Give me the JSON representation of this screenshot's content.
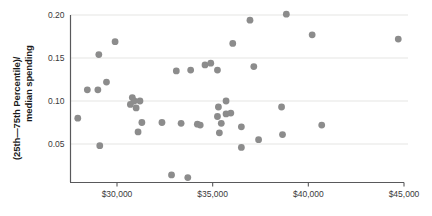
{
  "chart_data": {
    "type": "scatter",
    "title": "",
    "xlabel": "",
    "ylabel": "(25th—75th Percentile)/ median spending",
    "ylabel_line1": "(25th—75th Percentile)/",
    "ylabel_line2": "median spending",
    "xlim": [
      27600,
      45600
    ],
    "ylim": [
      0.0,
      0.2
    ],
    "xticks": [
      30000,
      35000,
      40000,
      45000
    ],
    "xtick_labels": [
      "$30,000",
      "$35,000",
      "$40,000",
      "$45,000"
    ],
    "yticks": [
      0.05,
      0.1,
      0.15,
      0.2
    ],
    "ytick_labels": [
      "0.05",
      "0.10",
      "0.15",
      "0.20"
    ],
    "grid": "horizontal",
    "legend": "none",
    "marker_color": "#8c8c8c",
    "gridline_color": "#dededc",
    "axis_color": "#59595b",
    "points": [
      {
        "x": 29900,
        "y": 0.169
      },
      {
        "x": 29050,
        "y": 0.154
      },
      {
        "x": 28450,
        "y": 0.113
      },
      {
        "x": 29000,
        "y": 0.113
      },
      {
        "x": 29450,
        "y": 0.122
      },
      {
        "x": 27950,
        "y": 0.08
      },
      {
        "x": 29100,
        "y": 0.048
      },
      {
        "x": 30800,
        "y": 0.104
      },
      {
        "x": 30900,
        "y": 0.1
      },
      {
        "x": 30700,
        "y": 0.096
      },
      {
        "x": 31000,
        "y": 0.092
      },
      {
        "x": 31200,
        "y": 0.1
      },
      {
        "x": 31300,
        "y": 0.075
      },
      {
        "x": 31100,
        "y": 0.064
      },
      {
        "x": 32350,
        "y": 0.075
      },
      {
        "x": 33100,
        "y": 0.135
      },
      {
        "x": 33850,
        "y": 0.136
      },
      {
        "x": 34600,
        "y": 0.142
      },
      {
        "x": 34900,
        "y": 0.144
      },
      {
        "x": 33350,
        "y": 0.074
      },
      {
        "x": 34200,
        "y": 0.073
      },
      {
        "x": 34350,
        "y": 0.072
      },
      {
        "x": 32850,
        "y": 0.014
      },
      {
        "x": 33700,
        "y": 0.011
      },
      {
        "x": 35250,
        "y": 0.136
      },
      {
        "x": 36050,
        "y": 0.167
      },
      {
        "x": 36950,
        "y": 0.194
      },
      {
        "x": 35700,
        "y": 0.1
      },
      {
        "x": 35300,
        "y": 0.093
      },
      {
        "x": 35950,
        "y": 0.086
      },
      {
        "x": 35250,
        "y": 0.082
      },
      {
        "x": 35450,
        "y": 0.074
      },
      {
        "x": 35700,
        "y": 0.085
      },
      {
        "x": 35350,
        "y": 0.063
      },
      {
        "x": 36500,
        "y": 0.07
      },
      {
        "x": 37150,
        "y": 0.14
      },
      {
        "x": 37400,
        "y": 0.055
      },
      {
        "x": 36500,
        "y": 0.046
      },
      {
        "x": 38850,
        "y": 0.201
      },
      {
        "x": 38600,
        "y": 0.093
      },
      {
        "x": 38650,
        "y": 0.061
      },
      {
        "x": 40200,
        "y": 0.177
      },
      {
        "x": 40700,
        "y": 0.072
      },
      {
        "x": 44700,
        "y": 0.172
      }
    ]
  }
}
